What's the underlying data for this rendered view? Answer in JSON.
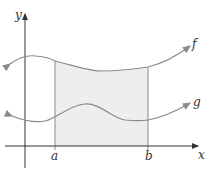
{
  "diagram": {
    "type": "area-between-curves",
    "axes": {
      "x_label": "x",
      "y_label": "y"
    },
    "bounds": {
      "a_label": "a",
      "b_label": "b"
    },
    "curves": [
      {
        "name": "f",
        "label": "f",
        "position": "upper"
      },
      {
        "name": "g",
        "label": "g",
        "position": "lower"
      }
    ],
    "shaded_region": {
      "from": "a",
      "to": "b",
      "between": "f and x-axis"
    },
    "colors": {
      "axis": "#333333",
      "curve": "#8a8a8a",
      "shade": "#eeeeee",
      "bound_line": "#8a8a8a",
      "text": "#333333"
    }
  }
}
